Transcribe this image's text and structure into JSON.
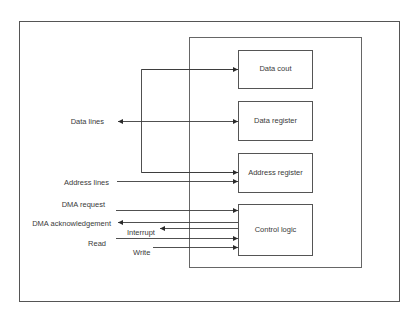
{
  "diagram": {
    "colors": {
      "line": "#3c3c3c",
      "frame": "#555555",
      "text": "#3a3a3a",
      "background": "#ffffff"
    },
    "blocks": [
      {
        "id": "data_count",
        "label": "Data cout"
      },
      {
        "id": "data_register",
        "label": "Data register"
      },
      {
        "id": "address_register",
        "label": "Address register"
      },
      {
        "id": "control_logic",
        "label": "Control logic"
      }
    ],
    "signals": {
      "data_lines": "Data lines",
      "address_lines": "Address lines",
      "dma_request": "DMA request",
      "dma_acknowledgement": "DMA acknowledgement",
      "interrupt": "Interrupt",
      "read": "Read",
      "write": "Write"
    },
    "connections": [
      {
        "from": "bus-connector",
        "to": "Data cout",
        "direction": "in"
      },
      {
        "from": "Data lines",
        "to": "Data register",
        "direction": "bidirectional"
      },
      {
        "from": "bus-connector",
        "to": "Address register",
        "direction": "in"
      },
      {
        "from": "Address lines",
        "to": "Address register",
        "direction": "in"
      },
      {
        "from": "DMA request",
        "to": "Control logic",
        "direction": "in"
      },
      {
        "from": "Control logic",
        "to": "DMA acknowledgement",
        "direction": "out"
      },
      {
        "from": "Control logic",
        "to": "Interrupt",
        "direction": "out"
      },
      {
        "from": "Read",
        "to": "Control logic",
        "direction": "in"
      },
      {
        "from": "Write",
        "to": "Control logic",
        "direction": "in"
      }
    ]
  }
}
